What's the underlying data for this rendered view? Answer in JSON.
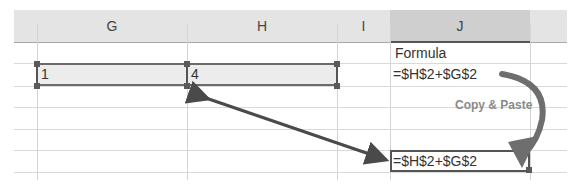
{
  "columns": [
    {
      "id": "G",
      "label": "G"
    },
    {
      "id": "H",
      "label": "H"
    },
    {
      "id": "I",
      "label": "I"
    },
    {
      "id": "J",
      "label": "J"
    }
  ],
  "cells": {
    "J1": "Formula",
    "G2": "1",
    "H2": "4",
    "J2": "=$H$2+$G$2",
    "J6": "=$H$2+$G$2"
  },
  "annotations": {
    "copy_paste_label": "Copy & Paste"
  },
  "colors": {
    "header_bg": "#e4e4e4",
    "selected_header_bg": "#cfcfcf",
    "arrow": "#4a4a4a",
    "curved_arrow": "#6e6e6e"
  }
}
